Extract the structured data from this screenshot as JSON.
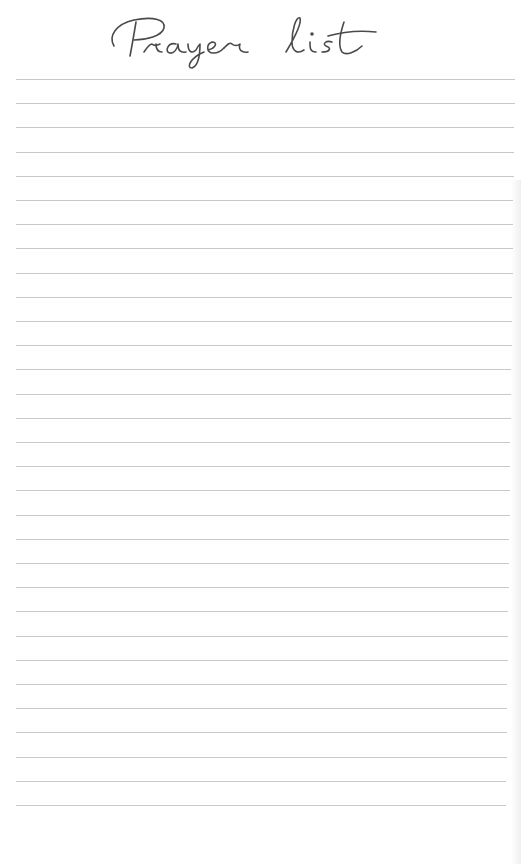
{
  "ruled_lines": {
    "count": 31,
    "first_y": 79,
    "spacing": 24.2,
    "color": "#c9c9c9"
  }
}
